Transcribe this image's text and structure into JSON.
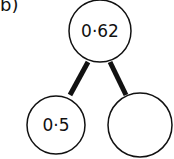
{
  "question_label": "b)",
  "tree": {
    "root": {
      "value": "0·62"
    },
    "left": {
      "value": "0·5"
    },
    "right": {
      "value": ""
    }
  }
}
